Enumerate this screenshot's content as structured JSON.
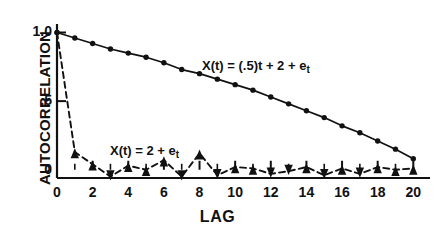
{
  "chart_data": {
    "type": "line",
    "title": "",
    "xlabel": "LAG",
    "ylabel": "AUTOCORRELATION",
    "xlim": [
      0,
      20.6
    ],
    "ylim": [
      -0.06,
      1.04
    ],
    "grid": false,
    "legend_position": "inline-annotations",
    "x_tick_labels": [
      "0",
      "2",
      "4",
      "6",
      "8",
      "10",
      "12",
      "14",
      "16",
      "18",
      "20"
    ],
    "x_tick_values": [
      0,
      2,
      4,
      6,
      8,
      10,
      12,
      14,
      16,
      18,
      20
    ],
    "x_minor_ticks": [
      1,
      3,
      5,
      7,
      9,
      11,
      13,
      15,
      17,
      19
    ],
    "y_tick_labels": [
      "1.0",
      ".5",
      "0"
    ],
    "y_tick_values": [
      1.0,
      0.5,
      0.0
    ],
    "x": [
      0,
      1,
      2,
      3,
      4,
      5,
      6,
      7,
      8,
      9,
      10,
      11,
      12,
      13,
      14,
      15,
      16,
      17,
      18,
      19,
      20
    ],
    "series": [
      {
        "name": "X(t) = (.5)t + 2 + e_t",
        "style": "solid",
        "marker": "filled-circle",
        "values": [
          1.0,
          0.96,
          0.92,
          0.88,
          0.85,
          0.82,
          0.78,
          0.73,
          0.7,
          0.66,
          0.62,
          0.58,
          0.53,
          0.48,
          0.43,
          0.38,
          0.32,
          0.27,
          0.21,
          0.15,
          0.08
        ]
      },
      {
        "name": "X(t) = 2 + e_t",
        "style": "dashed",
        "marker": "filled-triangle",
        "values": [
          1.0,
          0.13,
          0.04,
          -0.05,
          0.03,
          0.0,
          0.07,
          -0.05,
          0.12,
          -0.04,
          0.02,
          0.01,
          -0.03,
          -0.01,
          0.02,
          -0.04,
          0.01,
          -0.03,
          0.02,
          0.0,
          0.01
        ]
      }
    ],
    "annotations": [
      {
        "id": "upper-series-label",
        "text_parts": {
          "lead": "X(t) = (.5)t + 2 + e",
          "sub": "t"
        },
        "text": "X(t) = (.5)t + 2 + e_t",
        "x_px": 202,
        "y_px": 58
      },
      {
        "id": "lower-series-label",
        "text_parts": {
          "lead": "X(t) = 2 + e",
          "sub": "t"
        },
        "text": "X(t) = 2 + e_t",
        "x_px": 110,
        "y_px": 143
      }
    ],
    "colors": {
      "line": "#111111",
      "marker": "#111111",
      "axis": "#111111",
      "background": "#ffffff"
    }
  }
}
